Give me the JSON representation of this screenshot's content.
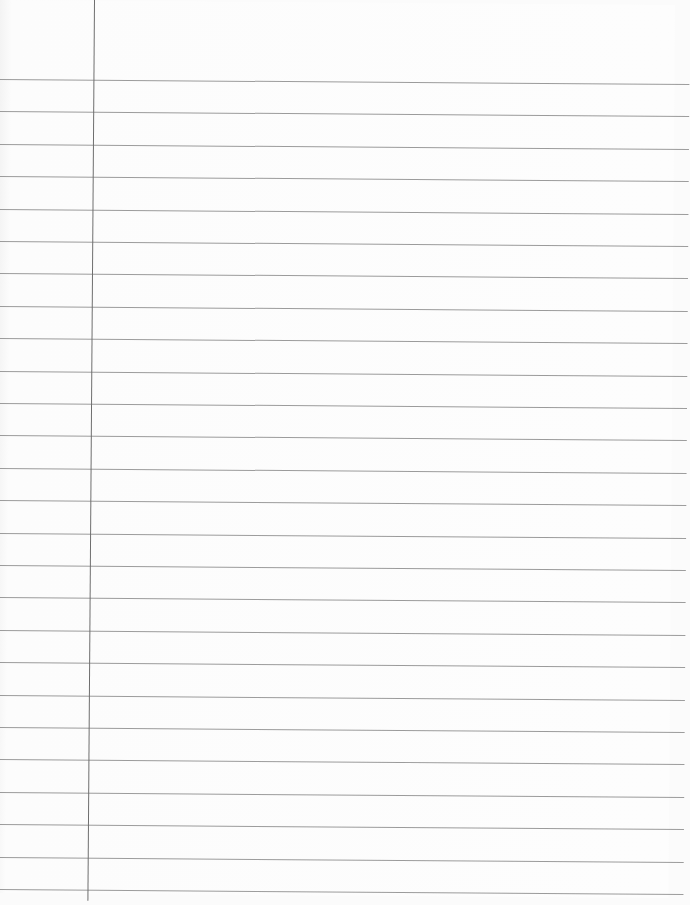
{
  "paper": {
    "type": "lined notebook paper",
    "content": "",
    "background_color": "#fcfcfc",
    "rule_color": "#8a8a8a",
    "margin_color": "#6e6e6e",
    "margin_x": 94,
    "first_rule_y": 79,
    "rule_spacing": 32.4,
    "rule_count": 26
  }
}
